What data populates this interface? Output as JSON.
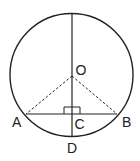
{
  "diagram": {
    "type": "geometry",
    "colors": {
      "stroke": "#222222",
      "background": "#ffffff"
    },
    "circle": {
      "center": "O",
      "cx": 71.5,
      "cy": 75,
      "r": 61.5
    },
    "points": {
      "O": {
        "label": "O",
        "x": 72,
        "y": 76
      },
      "A": {
        "label": "A",
        "x": 26,
        "y": 114
      },
      "B": {
        "label": "B",
        "x": 117,
        "y": 114
      },
      "C": {
        "label": "C",
        "x": 72,
        "y": 114
      },
      "D": {
        "label": "D",
        "x": 72,
        "y": 136
      }
    },
    "segments": [
      {
        "from": "top",
        "to": "D",
        "style": "solid",
        "name": "diameter"
      },
      {
        "from": "A",
        "to": "B",
        "style": "solid",
        "name": "chord-AB"
      },
      {
        "from": "O",
        "to": "A",
        "style": "dashed",
        "name": "radius-OA"
      },
      {
        "from": "O",
        "to": "B",
        "style": "dashed",
        "name": "radius-OB"
      }
    ],
    "right_angle_marker": {
      "at": "C"
    }
  }
}
